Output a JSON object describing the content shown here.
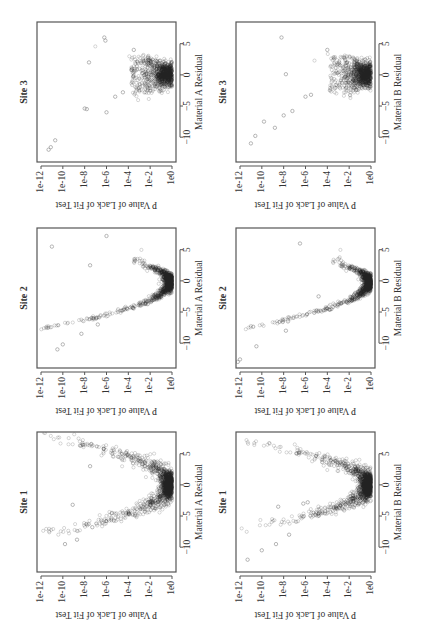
{
  "figure": {
    "orientation": "rotated-90-ccw",
    "axis_color": "#555555",
    "point_color": "#222222"
  },
  "chart_data": [
    {
      "type": "scatter",
      "title": "Site 1",
      "xlabel": "Material A Residual",
      "ylabel": "P Value of Lack of Fit Test",
      "x_ticks": [
        -10,
        -5,
        0,
        5
      ],
      "y_ticks": [
        "1e-12",
        "1e-10",
        "1e-8",
        "1e-6",
        "1e-4",
        "1e-2",
        "1e0"
      ],
      "xlim": [
        -13.5,
        8
      ],
      "ylim_neglog10": [
        0,
        12.5
      ],
      "shape": "v",
      "spread": 7.5,
      "density": 1400,
      "outliers": [
        [
          -9.5,
          9.8
        ],
        [
          -8.8,
          8.7
        ],
        [
          -3.2,
          9.1
        ],
        [
          3.0,
          7.5
        ],
        [
          -6.8,
          7.3
        ],
        [
          6.5,
          7.4
        ],
        [
          -4.5,
          5.5
        ]
      ]
    },
    {
      "type": "scatter",
      "title": "Site 2",
      "xlabel": "Material A Residual",
      "ylabel": "P Value of Lack of Fit Test",
      "x_ticks": [
        -10,
        -5,
        0,
        5
      ],
      "y_ticks": [
        "1e-12",
        "1e-10",
        "1e-8",
        "1e-6",
        "1e-4",
        "1e-2",
        "1e0"
      ],
      "xlim": [
        -13.5,
        8
      ],
      "ylim_neglog10": [
        0,
        12.5
      ],
      "shape": "left-tail",
      "spread": 4,
      "density": 1100,
      "outliers": [
        [
          -11,
          10.5
        ],
        [
          -10.2,
          10
        ],
        [
          -8.5,
          8.3
        ],
        [
          5.5,
          11.0
        ],
        [
          7.2,
          6.0
        ],
        [
          2.5,
          7.5
        ],
        [
          -7.0,
          6.8
        ]
      ]
    },
    {
      "type": "scatter",
      "title": "Site 3",
      "xlabel": "Material A Residual",
      "ylabel": "P Value of Lack of Fit Test",
      "x_ticks": [
        -10,
        -5,
        0,
        5
      ],
      "y_ticks": [
        "1e-12",
        "1e-10",
        "1e-8",
        "1e-6",
        "1e-4",
        "1e-2",
        "1e0"
      ],
      "xlim": [
        -13.5,
        8
      ],
      "ylim_neglog10": [
        0,
        12.5
      ],
      "shape": "cap",
      "spread": 3,
      "density": 900,
      "outliers": [
        [
          -12,
          11.3
        ],
        [
          -11.6,
          11.1
        ],
        [
          -10.5,
          10.7
        ],
        [
          -6.0,
          6.0
        ],
        [
          -5.5,
          7.8
        ],
        [
          -5.4,
          8.0
        ],
        [
          6.0,
          6.2
        ],
        [
          5.5,
          6.1
        ],
        [
          2.0,
          7.6
        ],
        [
          -3.5,
          5.2
        ],
        [
          -2.8,
          4.5
        ],
        [
          4.0,
          3.5
        ]
      ]
    },
    {
      "type": "scatter",
      "title": "Site 1",
      "xlabel": "Material B Residual",
      "ylabel": "P Value of Lack of Fit Test",
      "x_ticks": [
        -10,
        -5,
        0,
        5
      ],
      "y_ticks": [
        "1e-12",
        "1e-10",
        "1e-8",
        "1e-6",
        "1e-4",
        "1e-2",
        "1e0"
      ],
      "xlim": [
        -13.5,
        8
      ],
      "ylim_neglog10": [
        0,
        12.5
      ],
      "shape": "v",
      "spread": 6,
      "density": 1400,
      "outliers": [
        [
          -12,
          11.3
        ],
        [
          -10.5,
          10.0
        ],
        [
          -9.5,
          8.7
        ],
        [
          -3.5,
          8.5
        ],
        [
          -3.0,
          6.2
        ],
        [
          -2.8,
          5.8
        ],
        [
          -8.0,
          7.5
        ]
      ]
    },
    {
      "type": "scatter",
      "title": "Site 2",
      "xlabel": "Material B Residual",
      "ylabel": "P Value of Lack of Fit Test",
      "x_ticks": [
        -10,
        -5,
        0,
        5
      ],
      "y_ticks": [
        "1e-12",
        "1e-10",
        "1e-8",
        "1e-6",
        "1e-4",
        "1e-2",
        "1e0"
      ],
      "xlim": [
        -13.5,
        8
      ],
      "ylim_neglog10": [
        0,
        12.5
      ],
      "shape": "left-tail",
      "spread": 3.2,
      "density": 1000,
      "outliers": [
        [
          -13,
          12.2
        ],
        [
          -12.6,
          12.0
        ],
        [
          -10.5,
          10.5
        ],
        [
          -8.0,
          7.8
        ],
        [
          -6.5,
          7.6
        ],
        [
          6.0,
          6.5
        ],
        [
          -2.5,
          4.8
        ]
      ]
    },
    {
      "type": "scatter",
      "title": "Site 3",
      "xlabel": "Material B Residual",
      "ylabel": "P Value of Lack of Fit Test",
      "x_ticks": [
        -10,
        -5,
        0,
        5
      ],
      "y_ticks": [
        "1e-12",
        "1e-10",
        "1e-8",
        "1e-6",
        "1e-4",
        "1e-2",
        "1e0"
      ],
      "xlim": [
        -13.5,
        8
      ],
      "ylim_neglog10": [
        0,
        12.5
      ],
      "shape": "cap",
      "spread": 2.6,
      "density": 900,
      "outliers": [
        [
          -11,
          11.0
        ],
        [
          -9.8,
          10.6
        ],
        [
          -8.5,
          8.8
        ],
        [
          -7.5,
          9.8
        ],
        [
          -6.5,
          8.0
        ],
        [
          -5.8,
          7.2
        ],
        [
          0.1,
          7.8
        ],
        [
          6.0,
          8.2
        ],
        [
          -3.5,
          6.0
        ],
        [
          -3.2,
          5.5
        ],
        [
          4.0,
          4.0
        ]
      ]
    }
  ],
  "layout": {
    "panels": [
      {
        "ref": 2,
        "x": 37,
        "y": 22
      },
      {
        "ref": 1,
        "x": 37,
        "y": 228
      },
      {
        "ref": 0,
        "x": 37,
        "y": 432
      },
      {
        "ref": 5,
        "x": 236,
        "y": 22
      },
      {
        "ref": 4,
        "x": 236,
        "y": 228
      },
      {
        "ref": 3,
        "x": 236,
        "y": 432
      }
    ]
  }
}
